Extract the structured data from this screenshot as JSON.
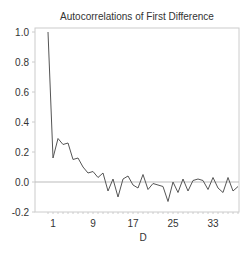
{
  "chart_data": {
    "type": "line",
    "title": "Autocorrelations of First Difference",
    "xlabel": "D",
    "ylabel": "",
    "ylim": [
      -0.2,
      1.0
    ],
    "xlim": [
      0,
      39
    ],
    "grid": false,
    "reference_line": 0.0,
    "y_ticks": [
      "-0.2",
      "0.0",
      "0.2",
      "0.4",
      "0.6",
      "0.8",
      "1.0"
    ],
    "y_tick_values": [
      -0.2,
      0.0,
      0.2,
      0.4,
      0.6,
      0.8,
      1.0
    ],
    "x_ticks": [
      "1",
      "9",
      "17",
      "25",
      "33"
    ],
    "x_tick_values": [
      1,
      9,
      17,
      25,
      33
    ],
    "x": [
      0,
      1,
      2,
      3,
      4,
      5,
      6,
      7,
      8,
      9,
      10,
      11,
      12,
      13,
      14,
      15,
      16,
      17,
      18,
      19,
      20,
      21,
      22,
      23,
      24,
      25,
      26,
      27,
      28,
      29,
      30,
      31,
      32,
      33,
      34,
      35,
      36,
      37,
      38
    ],
    "values": [
      1.0,
      0.16,
      0.29,
      0.25,
      0.26,
      0.15,
      0.16,
      0.1,
      0.06,
      0.07,
      0.03,
      0.06,
      -0.06,
      0.02,
      -0.1,
      0.02,
      0.04,
      -0.02,
      -0.04,
      0.05,
      -0.05,
      -0.01,
      -0.02,
      -0.03,
      -0.13,
      0.0,
      -0.07,
      0.02,
      -0.06,
      0.01,
      0.02,
      0.01,
      -0.05,
      0.03,
      -0.04,
      -0.07,
      0.03,
      -0.06,
      -0.03
    ],
    "series": [
      {
        "name": "Autocorrelation",
        "color": "#555555"
      }
    ]
  },
  "colors": {
    "line": "#555555",
    "frame": "#cccccc",
    "reference": "#bbbbbb",
    "text": "#333333"
  }
}
